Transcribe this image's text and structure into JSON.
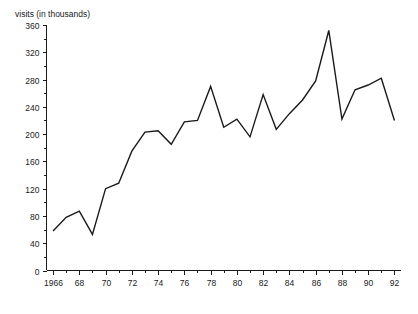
{
  "chart_data": {
    "type": "line",
    "title": "",
    "ylabel": "visits (in thousands)",
    "xlabel": "",
    "ylim": [
      0,
      360
    ],
    "y_major_step": 40,
    "y_minor_step": 20,
    "grid": false,
    "legend": "none",
    "y_ticks": [
      "0",
      "40",
      "80",
      "120",
      "160",
      "200",
      "240",
      "280",
      "320",
      "360"
    ],
    "x_ticks": [
      "1966",
      "68",
      "70",
      "72",
      "74",
      "76",
      "78",
      "80",
      "82",
      "84",
      "86",
      "88",
      "90",
      "92"
    ],
    "x_tick_values": [
      1966,
      1968,
      1970,
      1972,
      1974,
      1976,
      1978,
      1980,
      1982,
      1984,
      1986,
      1988,
      1990,
      1992
    ],
    "xlim": [
      1965.5,
      1992.5
    ],
    "x": [
      1966,
      1967,
      1968,
      1969,
      1970,
      1971,
      1972,
      1973,
      1974,
      1975,
      1976,
      1977,
      1978,
      1979,
      1980,
      1981,
      1982,
      1983,
      1984,
      1985,
      1986,
      1987,
      1988,
      1989,
      1990,
      1991,
      1992
    ],
    "values": [
      58,
      78,
      87,
      53,
      120,
      128,
      175,
      203,
      205,
      185,
      218,
      220,
      270,
      210,
      222,
      196,
      258,
      207,
      230,
      250,
      278,
      352,
      222,
      265,
      272,
      282,
      220
    ],
    "series": [
      {
        "name": "visits",
        "color": "#1a1a1a",
        "values": [
          58,
          78,
          87,
          53,
          120,
          128,
          175,
          203,
          205,
          185,
          218,
          220,
          270,
          210,
          222,
          196,
          258,
          207,
          230,
          250,
          278,
          352,
          222,
          265,
          272,
          282,
          220
        ]
      }
    ]
  },
  "colors": {
    "line": "#1a1a1a",
    "axis": "#1a1a1a",
    "background": "#ffffff"
  }
}
